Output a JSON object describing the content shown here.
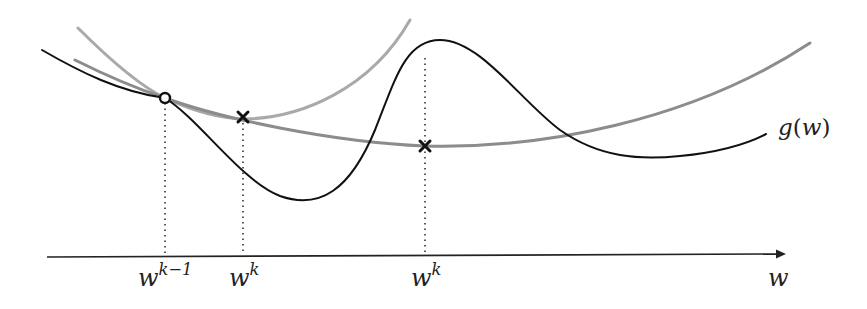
{
  "figure": {
    "axis": {
      "label": "w"
    },
    "function_label": {
      "name": "g",
      "arg": "w",
      "open": "(",
      "close": ")"
    },
    "ticks": [
      {
        "base": "w",
        "sup": "k−1",
        "x": 165
      },
      {
        "base": "w",
        "sup": "k",
        "x": 243
      },
      {
        "base": "w",
        "sup": "k",
        "x": 425
      }
    ],
    "markers": [
      {
        "type": "open-circle",
        "x": 165,
        "y": 98
      },
      {
        "type": "cross",
        "x": 243,
        "y": 117
      },
      {
        "type": "cross",
        "x": 425,
        "y": 146
      }
    ],
    "colors": {
      "objective": "#111111",
      "surrogate_narrow": "#a8a8a8",
      "surrogate_wide": "#8a8a8a",
      "axis": "#222222",
      "dotted": "#333333"
    }
  }
}
